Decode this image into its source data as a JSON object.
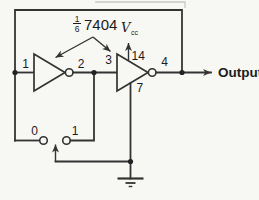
{
  "diagram": {
    "ic_label": {
      "fraction_numerator": "1",
      "fraction_denominator": "6",
      "part_number": "7404"
    },
    "power": {
      "vcc_symbol": "V",
      "vcc_subscript": "cc",
      "vcc_pin": "14"
    },
    "ground_pin": "7",
    "pins": {
      "inverter1_input": "1",
      "inverter1_output": "2",
      "inverter2_input": "3",
      "inverter2_output": "4"
    },
    "switch": {
      "contact0_label": "0",
      "contact1_label": "1"
    },
    "output_label": "Output",
    "colors": {
      "line": "#333333",
      "text": "#1c1c1c",
      "background": "#f7f7f4",
      "scan_artifact": "#c9c9c4"
    }
  }
}
